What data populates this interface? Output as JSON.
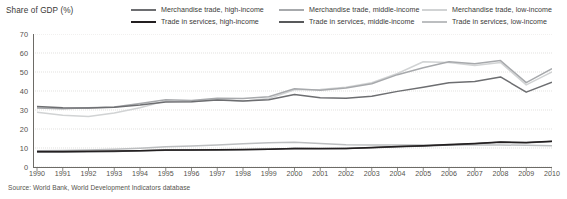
{
  "ylabel": "Share of GDP (%)",
  "source": "Source: World Bank, World Development Indicators database",
  "legend": {
    "columns": [
      {
        "rows": [
          {
            "label": "Merchandise trade, high-income",
            "color": "#6d6e71",
            "width": "2.1px"
          },
          {
            "label": "Trade in services, high-income",
            "color": "#231f20",
            "width": "2.1px"
          }
        ]
      },
      {
        "rows": [
          {
            "label": "Merchandise trade, middle-income",
            "color": "#a7a9ac",
            "width": "2.1px"
          },
          {
            "label": "Trade in services, middle-income",
            "color": "#58595b",
            "width": "2.1px"
          }
        ]
      },
      {
        "rows": [
          {
            "label": "Merchandise trade, low-income",
            "color": "#d1d3d4",
            "width": "2.1px"
          },
          {
            "label": "Trade in services, low-income",
            "color": "#bcbec0",
            "width": "2.1px"
          }
        ]
      }
    ]
  },
  "axes": {
    "yticks": [
      "70",
      "60",
      "50",
      "40",
      "30",
      "20",
      "10",
      "0"
    ],
    "xticks": [
      "1990",
      "1991",
      "1992",
      "1993",
      "1994",
      "1995",
      "1996",
      "1997",
      "1998",
      "1999",
      "2000",
      "2001",
      "2002",
      "2003",
      "2004",
      "2005",
      "2006",
      "2007",
      "2008",
      "2009",
      "2010"
    ]
  },
  "chart_data": {
    "type": "line",
    "title": "",
    "xlabel": "",
    "ylabel": "Share of GDP (%)",
    "ylim": [
      0,
      70
    ],
    "ytick_step": 10,
    "grid": true,
    "grid_style": "dotted-horizontal",
    "legend_position": "top",
    "x": [
      1990,
      1991,
      1992,
      1993,
      1994,
      1995,
      1996,
      1997,
      1998,
      1999,
      2000,
      2001,
      2002,
      2003,
      2004,
      2005,
      2006,
      2007,
      2008,
      2009,
      2010
    ],
    "series": [
      {
        "name": "Merchandise trade, high-income",
        "color": "#6d6e71",
        "values": [
          31.8,
          31.2,
          31.0,
          31.4,
          32.6,
          34.2,
          34.3,
          35.2,
          34.8,
          35.4,
          38.2,
          36.4,
          36.2,
          37.2,
          39.8,
          42.0,
          44.4,
          45.0,
          47.4,
          39.4,
          44.6
        ]
      },
      {
        "name": "Merchandise trade, middle-income",
        "color": "#a7a9ac",
        "values": [
          31.0,
          30.6,
          31.2,
          31.6,
          33.4,
          35.4,
          35.0,
          36.2,
          36.0,
          37.0,
          41.2,
          40.4,
          41.6,
          43.8,
          48.6,
          52.2,
          55.4,
          54.4,
          56.0,
          44.4,
          51.8
        ]
      },
      {
        "name": "Merchandise trade, low-income",
        "color": "#d1d3d4",
        "values": [
          28.8,
          27.2,
          26.6,
          28.4,
          31.2,
          34.8,
          34.4,
          35.6,
          34.6,
          36.0,
          40.6,
          40.8,
          42.0,
          44.4,
          49.2,
          55.4,
          55.0,
          53.4,
          55.0,
          43.2,
          50.0
        ]
      },
      {
        "name": "Trade in services, high-income",
        "color": "#231f20",
        "values": [
          8.2,
          8.2,
          8.3,
          8.4,
          8.6,
          8.9,
          9.0,
          9.1,
          9.2,
          9.4,
          9.8,
          9.7,
          9.8,
          10.2,
          10.8,
          11.2,
          11.8,
          12.4,
          13.2,
          12.9,
          13.6
        ]
      },
      {
        "name": "Trade in services, middle-income",
        "color": "#58595b",
        "values": [
          7.9,
          7.9,
          8.0,
          8.2,
          8.5,
          8.8,
          8.9,
          9.0,
          9.1,
          9.3,
          9.7,
          9.6,
          9.8,
          10.1,
          10.7,
          11.1,
          11.6,
          12.2,
          13.0,
          12.7,
          13.4
        ]
      },
      {
        "name": "Trade in services, low-income",
        "color": "#bcbec0",
        "values": [
          8.6,
          8.7,
          8.9,
          9.3,
          9.9,
          10.6,
          11.1,
          11.6,
          12.2,
          12.7,
          13.0,
          12.4,
          11.7,
          11.6,
          11.6,
          11.6,
          11.6,
          11.6,
          11.6,
          11.4,
          11.2
        ]
      }
    ]
  }
}
